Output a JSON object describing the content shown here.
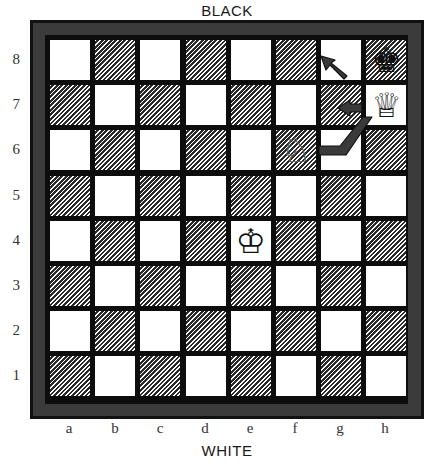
{
  "labels": {
    "top": "BLACK",
    "bottom": "WHITE",
    "ranks": [
      "8",
      "7",
      "6",
      "5",
      "4",
      "3",
      "2",
      "1"
    ],
    "files": [
      "a",
      "b",
      "c",
      "d",
      "e",
      "f",
      "g",
      "h"
    ]
  },
  "board": {
    "orientation": "white-bottom",
    "dark_square_style": "hatched",
    "frame_color": "#3b3b3b",
    "grid_color": "#0d0d0d"
  },
  "pieces": [
    {
      "square": "h8",
      "color": "black",
      "type": "king",
      "glyph": "♚",
      "name": "black-king-icon"
    },
    {
      "square": "h7",
      "color": "white",
      "type": "queen",
      "glyph": "♕",
      "name": "white-queen-icon"
    },
    {
      "square": "f6",
      "color": "white",
      "type": "knight",
      "glyph": "♘",
      "name": "white-knight-icon"
    },
    {
      "square": "e4",
      "color": "white",
      "type": "king",
      "glyph": "♔",
      "name": "white-king-icon"
    }
  ],
  "arrows": [
    {
      "name": "arrow-h8-to-g8",
      "from": "h8",
      "to": "g8",
      "direction": "up-left"
    },
    {
      "name": "arrow-h7-to-g7",
      "from": "h7",
      "to": "g7",
      "direction": "left"
    },
    {
      "name": "arrow-g6-to-h7",
      "from": "g6",
      "to": "h7",
      "direction": "right-then-up"
    }
  ]
}
